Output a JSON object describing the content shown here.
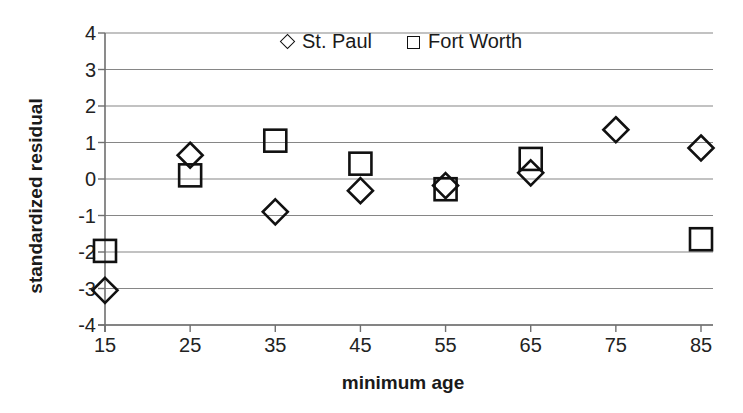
{
  "chart_data": {
    "type": "scatter",
    "title": "",
    "xlabel": "minimum age",
    "ylabel": "standardized residual",
    "xlim": [
      15,
      85
    ],
    "ylim": [
      -4,
      4
    ],
    "xticks": [
      15,
      25,
      35,
      45,
      55,
      65,
      75,
      85
    ],
    "yticks": [
      4,
      3,
      2,
      1,
      0,
      -1,
      -2,
      -3,
      -4
    ],
    "grid": "horizontal",
    "legend_position": "top-center",
    "x": [
      15,
      25,
      35,
      45,
      55,
      65,
      75,
      85
    ],
    "series": [
      {
        "name": "St. Paul",
        "marker": "diamond",
        "x": [
          15,
          25,
          35,
          45,
          55,
          65,
          75,
          85
        ],
        "values": [
          -3.05,
          0.65,
          -0.9,
          -0.32,
          -0.18,
          0.17,
          1.35,
          0.85
        ]
      },
      {
        "name": "Fort Worth",
        "marker": "square",
        "x": [
          15,
          25,
          35,
          45,
          55,
          65,
          85
        ],
        "values": [
          -1.97,
          0.1,
          1.05,
          0.42,
          -0.28,
          0.55,
          -1.65
        ]
      }
    ]
  },
  "axis": {
    "y_title": "standardized residual",
    "x_title": "minimum age",
    "y_tick_labels": [
      "4",
      "3",
      "2",
      "1",
      "0",
      "-1",
      "-2",
      "-3",
      "-4"
    ],
    "x_tick_labels": [
      "15",
      "25",
      "35",
      "45",
      "55",
      "65",
      "75",
      "85"
    ]
  },
  "legend": {
    "entries": [
      {
        "label": "St. Paul",
        "marker": "diamond"
      },
      {
        "label": "Fort Worth",
        "marker": "square"
      }
    ]
  },
  "colors": {
    "marker_stroke": "#111111",
    "gridline": "#868686",
    "axis_line": "#6f6f6f",
    "text": "#1a1a1a",
    "background": "#ffffff"
  }
}
